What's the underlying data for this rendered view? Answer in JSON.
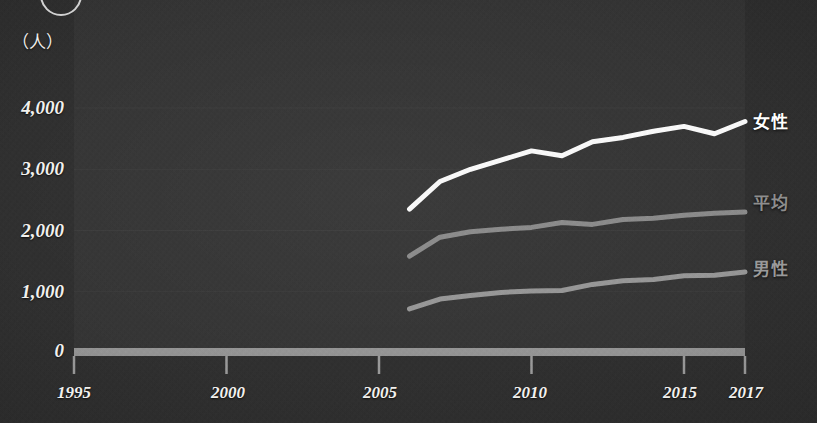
{
  "chart_data": {
    "type": "line",
    "title": "",
    "subtitle": "",
    "xlabel": "",
    "ylabel": "",
    "unit_label": "（人）",
    "x": [
      2006,
      2007,
      2008,
      2009,
      2010,
      2011,
      2012,
      2013,
      2014,
      2015,
      2016,
      2017
    ],
    "xlim": [
      1995,
      2017
    ],
    "ylim": [
      0,
      4300
    ],
    "x_tick_labels": [
      "1995",
      "2000",
      "2005",
      "2010",
      "2015",
      "2017"
    ],
    "x_tick_values": [
      1995,
      2000,
      2005,
      2010,
      2015,
      2017
    ],
    "y_tick_labels": [
      "4,000",
      "3,000",
      "2,000",
      "1,000",
      "0"
    ],
    "y_tick_values": [
      4000,
      3000,
      2000,
      1000,
      0
    ],
    "grid": true,
    "grid_axis": "y",
    "legend_position": "right-of-series-end",
    "series": [
      {
        "name": "女性",
        "color": "#ffffff",
        "width": 5,
        "values": [
          2350,
          2800,
          3000,
          3150,
          3300,
          3220,
          3450,
          3520,
          3620,
          3700,
          3580,
          3780
        ]
      },
      {
        "name": "平均",
        "color": "#8a8a8a",
        "width": 5,
        "values": [
          1580,
          1890,
          1980,
          2020,
          2050,
          2130,
          2100,
          2180,
          2200,
          2250,
          2280,
          2300
        ]
      },
      {
        "name": "男性",
        "color": "#979797",
        "width": 5,
        "values": [
          720,
          880,
          940,
          990,
          1010,
          1020,
          1120,
          1180,
          1200,
          1260,
          1270,
          1320
        ]
      }
    ]
  },
  "axes": {
    "y_ticks": [
      {
        "label": "4,000"
      },
      {
        "label": "3,000"
      },
      {
        "label": "2,000"
      },
      {
        "label": "1,000"
      },
      {
        "label": "0"
      }
    ],
    "x_ticks": [
      {
        "label": "1995"
      },
      {
        "label": "2000"
      },
      {
        "label": "2005"
      },
      {
        "label": "2010"
      },
      {
        "label": "2015"
      },
      {
        "label": "2017"
      }
    ],
    "unit": "（人）"
  },
  "legend": {
    "female": "女性",
    "average": "平均",
    "male": "男性"
  },
  "colors": {
    "background": "#2b2b2b",
    "plot_panel": "#303030",
    "female_line": "#ffffff",
    "average_line": "#8a8a8a",
    "male_line": "#979797",
    "axis_bar": "#9d9d9d",
    "gridline": "#3a3a3a",
    "tick_text": "#f2f1ee"
  }
}
